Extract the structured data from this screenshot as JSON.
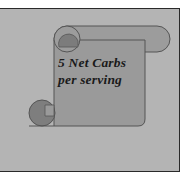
{
  "graphic": {
    "type": "scroll-banner",
    "text_line1": "5 Net Carbs",
    "text_line2": "per serving"
  },
  "colors": {
    "panel_background": "#b4b4b4",
    "panel_border": "#2a2a2a",
    "scroll_fill": "#999999",
    "scroll_curl": "#7e7e7e",
    "text": "#1a1a1a"
  }
}
